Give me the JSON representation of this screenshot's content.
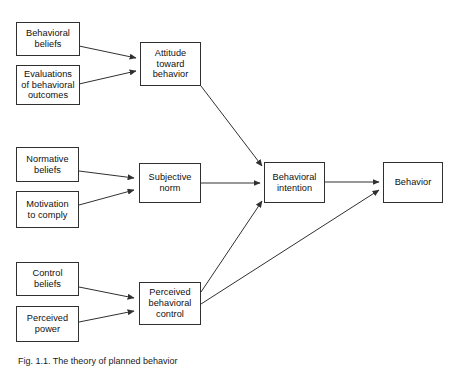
{
  "figure": {
    "caption": "Fig. 1.1. The theory of planned behavior",
    "stroke_color": "#303030",
    "text_color": "#101010",
    "background_color": "#ffffff"
  },
  "nodes": {
    "behavioral_beliefs": {
      "label": "Behavioral\nbeliefs"
    },
    "evaluations_of_behavioral_outcomes": {
      "label": "Evaluations\nof behavioral\noutcomes"
    },
    "attitude_toward_behavior": {
      "label": "Attitude\ntoward\nbehavior"
    },
    "normative_beliefs": {
      "label": "Normative\nbeliefs"
    },
    "motivation_to_comply": {
      "label": "Motivation\nto comply"
    },
    "subjective_norm": {
      "label": "Subjective\nnorm"
    },
    "control_beliefs": {
      "label": "Control\nbeliefs"
    },
    "perceived_power": {
      "label": "Perceived\npower"
    },
    "perceived_behavioral_control": {
      "label": "Perceived\nbehavioral\ncontrol"
    },
    "behavioral_intention": {
      "label": "Behavioral\nintention"
    },
    "behavior": {
      "label": "Behavior"
    }
  },
  "edges": [
    {
      "from": "behavioral_beliefs",
      "to": "attitude_toward_behavior"
    },
    {
      "from": "evaluations_of_behavioral_outcomes",
      "to": "attitude_toward_behavior"
    },
    {
      "from": "normative_beliefs",
      "to": "subjective_norm"
    },
    {
      "from": "motivation_to_comply",
      "to": "subjective_norm"
    },
    {
      "from": "control_beliefs",
      "to": "perceived_behavioral_control"
    },
    {
      "from": "perceived_power",
      "to": "perceived_behavioral_control"
    },
    {
      "from": "attitude_toward_behavior",
      "to": "behavioral_intention"
    },
    {
      "from": "subjective_norm",
      "to": "behavioral_intention"
    },
    {
      "from": "perceived_behavioral_control",
      "to": "behavioral_intention"
    },
    {
      "from": "perceived_behavioral_control",
      "to": "behavior"
    },
    {
      "from": "behavioral_intention",
      "to": "behavior"
    }
  ]
}
